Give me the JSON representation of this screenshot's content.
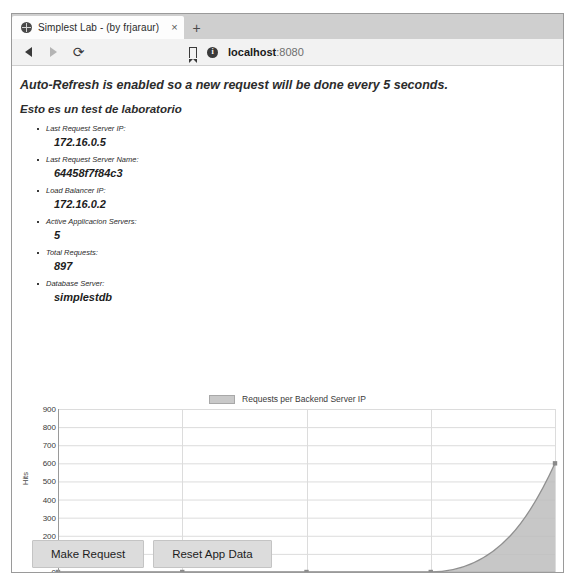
{
  "browser": {
    "tab": {
      "title": "Simplest Lab - (by frjaraur)",
      "close_label": "×",
      "favicon": "globe-icon"
    },
    "newtab_label": "+",
    "nav": {
      "back": "back-arrow-icon",
      "forward": "forward-arrow-icon",
      "reload_glyph": "⟳"
    },
    "address": {
      "bookmark": "bookmark-icon",
      "security": "info-icon",
      "security_glyph": "i",
      "host": "localhost",
      "port": ":8080",
      "full": "localhost:8080"
    }
  },
  "page": {
    "headline": "Auto-Refresh is enabled so a new request will be done every 5 seconds.",
    "subhead": "Esto es un test de laboratorio",
    "items": [
      {
        "label": "Last Request Server IP:",
        "value": "172.16.0.5"
      },
      {
        "label": "Last Request Server Name:",
        "value": "64458f7f84c3"
      },
      {
        "label": "Load Balancer IP:",
        "value": "172.16.0.2"
      },
      {
        "label": "Active Applicacion Servers:",
        "value": "5"
      },
      {
        "label": "Total Requests:",
        "value": "897"
      },
      {
        "label": "Database Server:",
        "value": "simplestdb"
      }
    ],
    "buttons": [
      {
        "label": "Make Request",
        "name": "make-request-button"
      },
      {
        "label": "Reset App Data",
        "name": "reset-app-data-button"
      }
    ]
  },
  "chart_data": {
    "type": "area",
    "title": "",
    "legend": [
      "Requests per Backend Server IP"
    ],
    "legend_position": "top-center",
    "categories": [
      "172.16.0.8",
      "172.16.0.5",
      "172.16.0.7",
      "172.16.0.6",
      "172.16.0.4"
    ],
    "values": [
      0,
      0,
      0,
      0,
      600
    ],
    "xlabel": "",
    "ylabel": "Hits",
    "ylim": [
      0,
      900
    ],
    "yticks": [
      0,
      100,
      200,
      300,
      400,
      500,
      600,
      700,
      800,
      900
    ],
    "grid": true,
    "series_color": "#bdbdbd",
    "line_color": "#8f8f8f",
    "grid_color": "#dcdcdc"
  }
}
